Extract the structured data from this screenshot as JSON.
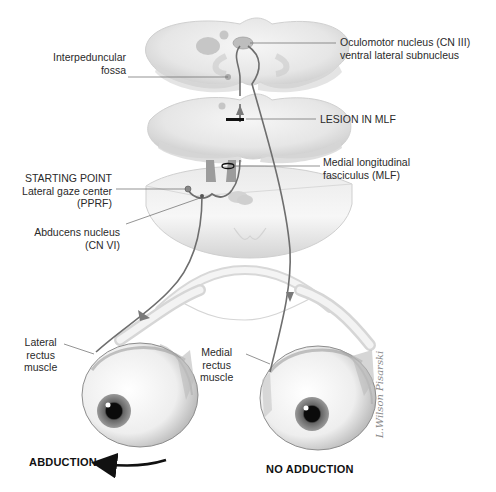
{
  "figure": {
    "colors": {
      "tissue": "#ececec",
      "tissue_shadow": "#c9c9c9",
      "nucleus": "#b8b8b8",
      "pathway": "#6e6e6e",
      "lesion": "#111111",
      "label_text": "#2a2a2a"
    }
  },
  "labels": {
    "oculomotor": {
      "line1": "Oculomotor nucleus (CN III)",
      "line2": "ventral lateral subnucleus"
    },
    "interpeduncular": {
      "line1": "Interpeduncular",
      "line2": "fossa"
    },
    "lesion": {
      "text": "LESION IN MLF"
    },
    "mlf": {
      "line1": "Medial longitudinal",
      "line2": "fasciculus (MLF)"
    },
    "starting_point": {
      "line1": "STARTING POINT",
      "line2": "Lateral gaze center",
      "line3": "(PPRF)"
    },
    "abducens": {
      "line1": "Abducens nucleus",
      "line2": "(CN VI)"
    },
    "lateral_rectus": {
      "line1": "Lateral",
      "line2": "rectus",
      "line3": "muscle"
    },
    "medial_rectus": {
      "line1": "Medial",
      "line2": "rectus",
      "line3": "muscle"
    },
    "abduction": {
      "text": "ABDUCTION"
    },
    "no_adduction": {
      "text": "NO ADDUCTION"
    },
    "signature": {
      "text": "L.Wilson Pisarski"
    }
  }
}
